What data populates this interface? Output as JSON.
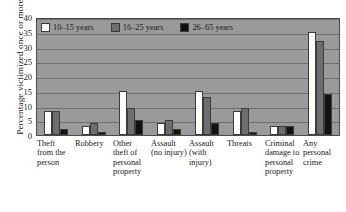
{
  "chart_data": {
    "type": "bar",
    "title": "",
    "xlabel": "",
    "ylabel": "Percentage victimized once or more",
    "ylim": [
      0,
      40
    ],
    "yticks": [
      0,
      5,
      10,
      15,
      20,
      25,
      30,
      35,
      40
    ],
    "ytick_labels": [
      "0",
      "5",
      "10",
      "15",
      "20",
      "25",
      "30",
      "35",
      "40"
    ],
    "grid": true,
    "legend_position": "top-left-inside",
    "categories": [
      "Theft from the person",
      "Robbery",
      "Other theft of personal property",
      "Assault (no injury)",
      "Assault (with injury)",
      "Threats",
      "Criminal damage to personal property",
      "Any personal crime"
    ],
    "series": [
      {
        "name": "10–15 years",
        "color": "#fdfdfa",
        "values": [
          8,
          3,
          15,
          4,
          15,
          8,
          3,
          35
        ]
      },
      {
        "name": "16–25 years",
        "color": "#6e6e6e",
        "values": [
          8,
          4,
          9,
          5,
          13,
          9,
          3,
          32
        ]
      },
      {
        "name": "26–65 years",
        "color": "#121212",
        "values": [
          2,
          1,
          5,
          2,
          4,
          1,
          3,
          14
        ]
      }
    ]
  },
  "axis": {
    "y_title": "Percentage victimized once or more"
  },
  "x_labels": [
    "Theft from the person",
    "Robbery",
    "Other theft of personal property",
    "Assault (no injury)",
    "Assault (with injury)",
    "Threats",
    "Criminal damage to personal property",
    "Any personal crime"
  ],
  "colors": {
    "plot_background": "#9a9a9a",
    "gridline": "#6f6f6f",
    "axis": "#4a4a4a",
    "page_background": "#ffffff"
  }
}
